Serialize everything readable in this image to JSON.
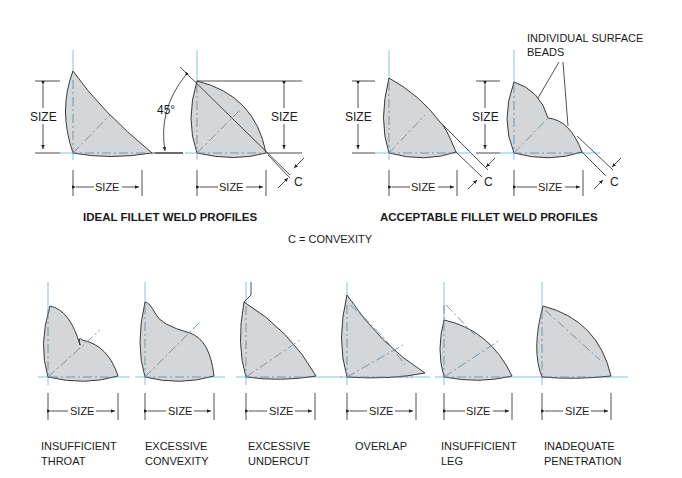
{
  "diagram": {
    "top_left": {
      "title": "IDEAL FILLET WELD PROFILES",
      "profiles": [
        {
          "size_v": "SIZE",
          "size_h": "SIZE"
        },
        {
          "angle": "45°",
          "size_v": "SIZE",
          "size_h": "SIZE",
          "c": "C"
        }
      ]
    },
    "top_right": {
      "title": "ACCEPTABLE FILLET WELD PROFILES",
      "callout": "INDIVIDUAL SURFACE BEADS",
      "callout_line1": "INDIVIDUAL SURFACE",
      "callout_line2": "BEADS",
      "profiles": [
        {
          "size_v": "SIZE",
          "size_h": "SIZE",
          "c": "C"
        },
        {
          "size_v": "SIZE",
          "size_h": "SIZE",
          "c": "C"
        }
      ]
    },
    "legend": "C = CONVEXITY",
    "defects": [
      {
        "line1": "INSUFFICIENT",
        "line2": "THROAT",
        "size": "SIZE"
      },
      {
        "line1": "EXCESSIVE",
        "line2": "CONVEXITY",
        "size": "SIZE"
      },
      {
        "line1": "EXCESSIVE",
        "line2": "UNDERCUT",
        "size": "SIZE"
      },
      {
        "line1": "OVERLAP",
        "line2": "",
        "size": "SIZE"
      },
      {
        "line1": "INSUFFICIENT",
        "line2": "LEG",
        "size": "SIZE"
      },
      {
        "line1": "INADEQUATE",
        "line2": "PENETRATION",
        "size": "SIZE"
      }
    ],
    "colors": {
      "weld_fill": "#d4d6d8",
      "outline": "#3a3a3a",
      "centerline": "#7fb8d8"
    }
  }
}
